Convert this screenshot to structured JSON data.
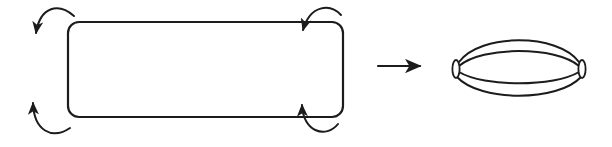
{
  "figure": {
    "paper_color": "#ffffff",
    "ink_color": "#1c1c1c",
    "canvas": {
      "width": 612,
      "height": 147
    },
    "rectangle": {
      "x": 68,
      "y": 22,
      "width": 275,
      "height": 95,
      "corner_radius": 11
    },
    "gluing_arrows": [
      {
        "name": "top-left-curl",
        "path": "M 74 16 C 58 2, 40 7, 36 33"
      },
      {
        "name": "bottom-left-curl",
        "path": "M 70 128 C 52 140, 34 131, 33 103"
      },
      {
        "name": "top-right-curl",
        "path": "M 341 15 C 330 3, 310 5, 303 30"
      },
      {
        "name": "bottom-right-curl",
        "path": "M 338 124 C 326 139, 303 132, 302 105"
      }
    ],
    "maps_to_arrow": {
      "path": "M 378 66 L 420 66"
    },
    "lens": {
      "left_cap": {
        "cx": 456,
        "cy": 69,
        "rx": 3.6,
        "ry": 9
      },
      "right_cap": {
        "cx": 582,
        "cy": 69,
        "rx": 3.6,
        "ry": 9
      },
      "meridians": [
        "M 459 62 C 480 33, 558 33, 579 62",
        "M 459 66 C 482 46, 556 46, 579 66",
        "M 459 72 C 484 87, 554 87, 579 72",
        "M 457 77 C 480 102, 558 102, 581 77"
      ]
    }
  }
}
